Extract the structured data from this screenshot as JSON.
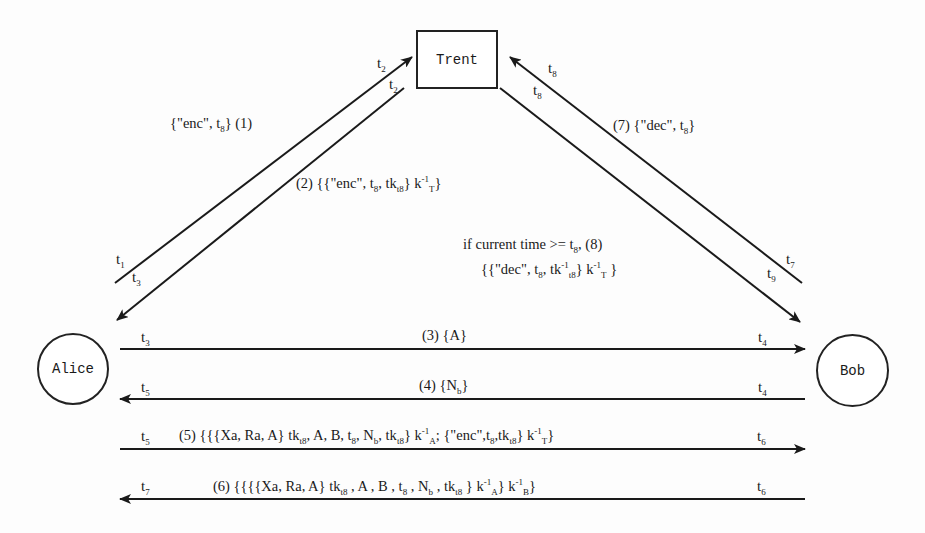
{
  "diagram": {
    "type": "protocol-sequence",
    "nodes": {
      "trent": {
        "label": "Trent",
        "shape": "box"
      },
      "alice": {
        "label": "Alice",
        "shape": "circle"
      },
      "bob": {
        "label": "Bob",
        "shape": "circle"
      }
    },
    "edges": [
      {
        "id": 1,
        "from": "Alice",
        "to": "Trent",
        "label": "{\"enc\", t_8} (1)",
        "start_time": "t1",
        "end_time": "t2"
      },
      {
        "id": 2,
        "from": "Trent",
        "to": "Alice",
        "label": "(2) {{\"enc\", t_8, tk_t8} k_T^-1}",
        "start_time": "t2",
        "end_time": "t3"
      },
      {
        "id": 3,
        "from": "Alice",
        "to": "Bob",
        "label": "(3) {A}",
        "start_time": "t3",
        "end_time": "t4"
      },
      {
        "id": 4,
        "from": "Bob",
        "to": "Alice",
        "label": "(4) {N_b}",
        "start_time": "t4",
        "end_time": "t5"
      },
      {
        "id": 5,
        "from": "Alice",
        "to": "Bob",
        "label": "(5) {{{Xa, Ra, A} tk_t8, A, B, t_8, N_b, tk_t8} k_A^-1, {\"enc\", t_8, tk_t8} k_T^-1}",
        "start_time": "t5",
        "end_time": "t6"
      },
      {
        "id": 6,
        "from": "Bob",
        "to": "Alice",
        "label": "(6) {{{{Xa, Ra, A} tk_t8, A, B, t_8, N_b, tk_t8} k_A^-1} k_B^-1}",
        "start_time": "t6",
        "end_time": "t7"
      },
      {
        "id": 7,
        "from": "Bob",
        "to": "Trent",
        "label": "(7) {\"dec\", t_8}",
        "start_time": "t7",
        "end_time": "t8"
      },
      {
        "id": 8,
        "from": "Trent",
        "to": "Bob",
        "label": "if current time >= t_8, (8) {{\"dec\", t_8, tk_t8^-1} k_T^-1}",
        "start_time": "t8",
        "end_time": "t9"
      }
    ]
  },
  "labels": {
    "trent": "Trent",
    "alice": "Alice",
    "bob": "Bob",
    "t": "t",
    "t_sub": {
      "1": "1",
      "2": "2",
      "3": "3",
      "4": "4",
      "5": "5",
      "6": "6",
      "7": "7",
      "8": "8",
      "9": "9"
    },
    "m1": {
      "pre": "{\"enc\", t",
      "sub": "8",
      "post": "}  (1)"
    },
    "m2": {
      "pre": "(2) {{\"enc\", t",
      "sub1": "8",
      "mid": ", tk",
      "sub2": "t8",
      "post": "} k",
      "sup": "-1",
      "sub3": "T",
      "end": "}"
    },
    "m3": "(3) {A}",
    "m4": {
      "pre": "(4) {N",
      "sub": "b",
      "post": "}"
    },
    "m7": {
      "pre": "(7)  {\"dec\", t",
      "sub": "8",
      "post": "}"
    },
    "m8": {
      "line1_pre": "if current time >= t",
      "line1_sub": "8",
      "line1_post": ",  (8)",
      "line2_pre": "{{\"dec\", t",
      "line2_sub1": "8",
      "line2_mid": ", tk",
      "line2_sup1": "-1",
      "line2_sub2": "t8",
      "line2_post": "} k",
      "line2_sup2": "-1",
      "line2_sub3": "T",
      "line2_end": " }"
    },
    "m5": {
      "a": "(5)  {{{Xa, Ra, A} tk",
      "a_sub": "t8",
      "b": ", A, B, t",
      "b_sub": "8",
      "c": ", N",
      "c_sub": "b",
      "d": ", tk",
      "d_sub": "t8",
      "e": "} k",
      "e_sup": "-1",
      "e_sub": "A",
      "f": "; {\"enc\",t",
      "f_sub": "8",
      "g": ",tk",
      "g_sub": "t8",
      "h": "} k",
      "h_sup": "-1",
      "h_sub": "T",
      "i": "}"
    },
    "m6": {
      "a": "(6)  {{{{Xa, Ra, A} tk",
      "a_sub": "t8",
      "b": " , A , B , t",
      "b_sub": "8",
      "c": " , N",
      "c_sub": "b",
      "d": " , tk",
      "d_sub": "t8",
      "e": " } k",
      "e_sup": "-1",
      "e_sub": "A",
      "f": "} k",
      "f_sup": "-1",
      "f_sub": "B",
      "g": "}"
    }
  },
  "colors": {
    "ink": "#1a1a1a",
    "background": "#fdfdfd"
  }
}
